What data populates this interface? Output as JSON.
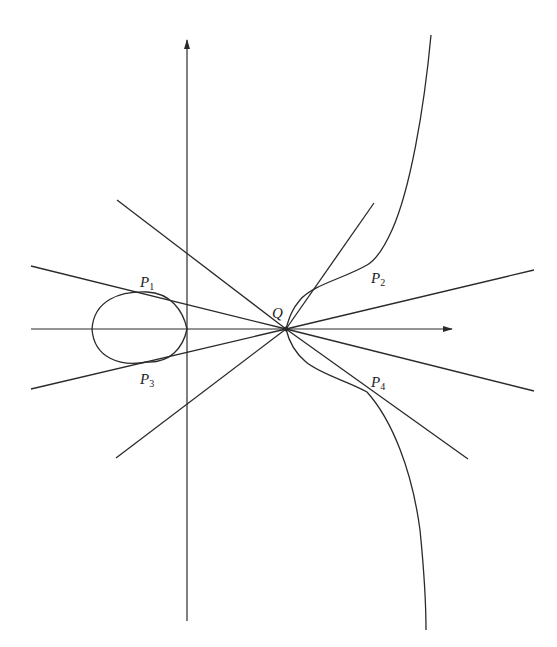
{
  "figure": {
    "colors": {
      "ink": "#2a2a2a",
      "background": "#ffffff"
    },
    "labels": {
      "Q": {
        "main": "Q",
        "sub": ""
      },
      "P1": {
        "main": "P",
        "sub": "1"
      },
      "P2": {
        "main": "P",
        "sub": "2"
      },
      "P3": {
        "main": "P",
        "sub": "3"
      },
      "P4": {
        "main": "P",
        "sub": "4"
      }
    },
    "points": {
      "Q": [
        286,
        329
      ],
      "P1": [
        147,
        292
      ],
      "P2": [
        367,
        265
      ],
      "P3": [
        147,
        362
      ],
      "P4": [
        367,
        392
      ]
    },
    "axes": {
      "x_axis": {
        "from": [
          31,
          329
        ],
        "to": [
          452,
          329
        ],
        "arrow": true
      },
      "y_axis": {
        "from": [
          187,
          621
        ],
        "to": [
          187,
          40
        ],
        "arrow": true
      }
    },
    "tangent_lines": [
      {
        "through": "P1",
        "from": [
          31,
          266
        ],
        "to": [
          286,
          329
        ]
      },
      {
        "through": "P3",
        "from": [
          31,
          389
        ],
        "to": [
          286,
          329
        ]
      },
      {
        "through": "P2",
        "from": [
          286,
          329
        ],
        "to": [
          374,
          203
        ]
      },
      {
        "through": "P4",
        "from": [
          286,
          329
        ],
        "to": [
          468,
          459
        ]
      },
      {
        "through": "",
        "from": [
          117,
          200
        ],
        "to": [
          286,
          329
        ]
      },
      {
        "through": "",
        "from": [
          116,
          458
        ],
        "to": [
          286,
          329
        ]
      },
      {
        "through": "",
        "from": [
          286,
          329
        ],
        "to": [
          534,
          270
        ]
      },
      {
        "through": "",
        "from": [
          286,
          329
        ],
        "to": [
          534,
          391
        ]
      }
    ]
  }
}
